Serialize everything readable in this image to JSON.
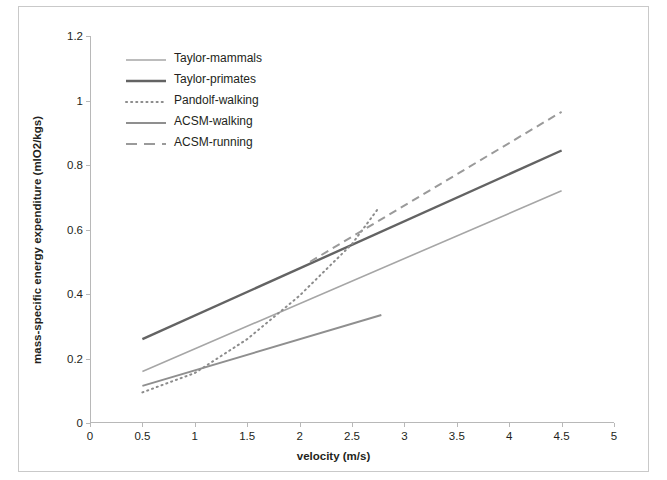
{
  "chart_data": {
    "type": "line",
    "title": "",
    "xlabel": "velocity (m/s)",
    "ylabel": "mass-specific energy expenditure (mlO2/kgs)",
    "xlim": [
      0,
      5
    ],
    "ylim": [
      0,
      1.2
    ],
    "xticks": [
      "0",
      "0.5",
      "1",
      "1.5",
      "2",
      "2.5",
      "3",
      "3.5",
      "4",
      "4.5",
      "5"
    ],
    "xtick_values": [
      0,
      0.5,
      1,
      1.5,
      2,
      2.5,
      3,
      3.5,
      4,
      4.5,
      5
    ],
    "yticks": [
      "0",
      "0.2",
      "0.4",
      "0.6",
      "0.8",
      "1",
      "1.2"
    ],
    "ytick_values": [
      0,
      0.2,
      0.4,
      0.6,
      0.8,
      1.0,
      1.2
    ],
    "grid": false,
    "legend_position": "upper-left-inside",
    "series": [
      {
        "name": "Taylor-mammals",
        "style": "solid",
        "color": "#a6a6a6",
        "width": 1.6,
        "points": [
          [
            0.5,
            0.16
          ],
          [
            4.5,
            0.72
          ]
        ]
      },
      {
        "name": "Taylor-primates",
        "style": "solid",
        "color": "#636363",
        "width": 2.4,
        "points": [
          [
            0.5,
            0.26
          ],
          [
            4.5,
            0.845
          ]
        ]
      },
      {
        "name": "Pandolf-walking",
        "style": "dotted",
        "color": "#8c8c8c",
        "width": 2.0,
        "points": [
          [
            0.5,
            0.095
          ],
          [
            1.0,
            0.155
          ],
          [
            1.5,
            0.26
          ],
          [
            2.0,
            0.395
          ],
          [
            2.5,
            0.555
          ],
          [
            2.75,
            0.665
          ]
        ]
      },
      {
        "name": "ACSM-walking",
        "style": "solid",
        "color": "#8f8f8f",
        "width": 2.0,
        "points": [
          [
            0.5,
            0.115
          ],
          [
            2.78,
            0.335
          ]
        ]
      },
      {
        "name": "ACSM-running",
        "style": "dashed",
        "color": "#9a9a9a",
        "width": 2.0,
        "points": [
          [
            2.1,
            0.5
          ],
          [
            4.5,
            0.965
          ]
        ]
      }
    ]
  }
}
